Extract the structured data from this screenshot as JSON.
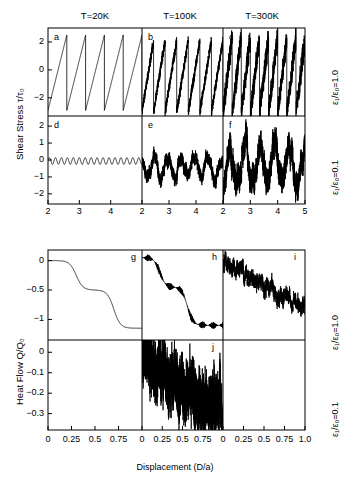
{
  "figure": {
    "column_titles": [
      "T=20K",
      "T=100K",
      "T=300K"
    ],
    "row_labels_right": [
      "ε₁/ε₀=1.0",
      "ε₁/ε₀=0.1"
    ],
    "panel_letters": [
      "a",
      "b",
      "c",
      "d",
      "e",
      "f",
      "g",
      "h",
      "i",
      "j"
    ]
  },
  "top_block": {
    "ylabel": "Shear Stress τ/τ₀",
    "xtick_labels": [
      "2",
      "3",
      "4",
      "2",
      "3",
      "4",
      "2",
      "3",
      "4",
      "5"
    ],
    "row1_yticks": [
      "2",
      "0",
      "-2"
    ],
    "row2_yticks": [
      "2",
      "1",
      "0",
      "-1",
      "-2"
    ]
  },
  "bottom_block": {
    "ylabel": "Heat Flow Q/Q₀",
    "xlabel": "Displacement (D/a)",
    "xtick_labels": [
      "0",
      "0.25",
      "0.5",
      "0.75",
      "0",
      "0.25",
      "0.5",
      "0.75",
      "0",
      "0.25",
      "0.5",
      "0.75",
      "1.0"
    ],
    "row1_yticks": [
      "0",
      "-0.5",
      "-1"
    ],
    "row2_yticks": [
      "0",
      "-0.1",
      "-0.2",
      "-0.3"
    ]
  },
  "chart_data": {
    "type": "line",
    "title": "",
    "grid": false,
    "legend": "none",
    "panels": [
      {
        "letter": "a",
        "temperature": "T=20K",
        "epsilon_ratio": "1.0",
        "xlabel": "",
        "ylabel": "Shear Stress τ/τ₀",
        "xlim": [
          2,
          5
        ],
        "ylim": [
          -3.3,
          3.0
        ],
        "yticks": [
          2,
          0,
          -2
        ],
        "xticks": [
          2,
          3,
          4
        ],
        "waveform": "sawtooth",
        "period": 0.55,
        "amp_high": 2.5,
        "amp_low": -2.9,
        "noise": 0.0,
        "description": "clean regular sawtooth stick-slip, sharp drops"
      },
      {
        "letter": "b",
        "temperature": "T=100K",
        "epsilon_ratio": "1.0",
        "xlim": [
          2,
          5
        ],
        "ylim": [
          -3.3,
          3.0
        ],
        "yticks": [
          2,
          0,
          -2
        ],
        "xticks": [
          2,
          3,
          4
        ],
        "waveform": "sawtooth",
        "period": 0.42,
        "amp_high": 2.1,
        "amp_low": -3.0,
        "noise": 0.28,
        "description": "sawtooth with moderate thermal noise"
      },
      {
        "letter": "c",
        "temperature": "T=300K",
        "epsilon_ratio": "1.0",
        "xlim": [
          2,
          5
        ],
        "ylim": [
          -3.3,
          3.0
        ],
        "yticks": [
          2,
          0,
          -2
        ],
        "xticks": [
          2,
          3,
          4,
          5
        ],
        "waveform": "sawtooth",
        "period": 0.33,
        "amp_high": 2.3,
        "amp_low": -3.1,
        "noise": 0.62,
        "description": "sawtooth heavily blurred by thermal noise"
      },
      {
        "letter": "d",
        "temperature": "T=20K",
        "epsilon_ratio": "0.1",
        "xlim": [
          2,
          5
        ],
        "ylim": [
          -2.6,
          2.6
        ],
        "yticks": [
          2,
          1,
          0,
          -1,
          -2
        ],
        "xticks": [
          2,
          3,
          4
        ],
        "waveform": "smooth_oscillation",
        "period": 0.19,
        "amp_high": 0.22,
        "amp_low": -0.22,
        "noise": 0.0,
        "description": "small smooth regular oscillation about zero, no stick-slip"
      },
      {
        "letter": "e",
        "temperature": "T=100K",
        "epsilon_ratio": "0.1",
        "xlim": [
          2,
          5
        ],
        "ylim": [
          -2.6,
          2.6
        ],
        "yticks": [
          2,
          1,
          0,
          -1,
          -2
        ],
        "xticks": [
          2,
          3,
          4
        ],
        "waveform": "random_walk",
        "period": 0.5,
        "amp_high": 0.6,
        "amp_low": -1.6,
        "noise": 0.35,
        "description": "irregular noisy fluctuation, smooth sliding regime"
      },
      {
        "letter": "f",
        "temperature": "T=300K",
        "epsilon_ratio": "0.1",
        "xlim": [
          2,
          5
        ],
        "ylim": [
          -2.6,
          2.6
        ],
        "yticks": [
          2,
          1,
          0,
          -1,
          -2
        ],
        "xticks": [
          2,
          3,
          4,
          5
        ],
        "waveform": "random_walk",
        "period": 0.55,
        "amp_high": 1.9,
        "amp_low": -2.5,
        "noise": 0.75,
        "description": "large-amplitude noisy fluctuation"
      },
      {
        "letter": "g",
        "temperature": "T=20K",
        "epsilon_ratio": "1.0",
        "ylabel": "Heat Flow Q/Q₀",
        "xlim": [
          0,
          1
        ],
        "ylim": [
          -1.35,
          0.18
        ],
        "yticks": [
          0,
          -0.5,
          -1
        ],
        "xticks": [
          0,
          0.25,
          0.5,
          0.75
        ],
        "waveform": "staircase",
        "steps": [
          0.0,
          -0.5,
          -1.15
        ],
        "step_positions": [
          0.3,
          0.7
        ],
        "noise": 0.0,
        "description": "clean descending staircase, two sharp drops"
      },
      {
        "letter": "h",
        "temperature": "T=100K",
        "epsilon_ratio": "1.0",
        "xlim": [
          0,
          1
        ],
        "ylim": [
          -1.35,
          0.18
        ],
        "yticks": [
          0,
          -0.5,
          -1
        ],
        "xticks": [
          0,
          0.25,
          0.5,
          0.75
        ],
        "waveform": "staircase",
        "steps": [
          0.05,
          -0.45,
          -1.1
        ],
        "step_positions": [
          0.22,
          0.56
        ],
        "noise": 0.06,
        "description": "descending staircase with noise on plateaus"
      },
      {
        "letter": "i",
        "temperature": "T=300K",
        "epsilon_ratio": "1.0",
        "xlim": [
          0,
          1
        ],
        "ylim": [
          -1.35,
          0.18
        ],
        "yticks": [
          0,
          -0.5,
          -1
        ],
        "xticks": [
          0,
          0.25,
          0.5,
          0.75,
          1.0
        ],
        "waveform": "noisy_decline",
        "steps": [
          0.05,
          -0.45,
          -0.78
        ],
        "step_positions": [
          0.2,
          0.45
        ],
        "noise": 0.11,
        "description": "noisy gradual decline, steps washed out"
      },
      {
        "letter": "j",
        "temperature": "T=100K",
        "epsilon_ratio": "0.1",
        "xlim": [
          0,
          1
        ],
        "ylim": [
          -0.38,
          0.06
        ],
        "yticks": [
          0,
          -0.1,
          -0.2,
          -0.3
        ],
        "xticks": [
          0,
          0.25,
          0.5,
          0.75
        ],
        "waveform": "noisy_decline",
        "steps": [
          0.0,
          -0.3
        ],
        "step_positions": [
          0.5
        ],
        "noise": 0.055,
        "description": "dense high-frequency noise declining from 0 to -0.3"
      }
    ]
  }
}
